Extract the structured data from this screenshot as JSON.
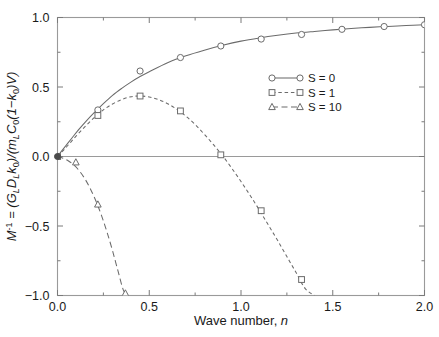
{
  "chart_data": {
    "type": "line",
    "title": "",
    "xlabel": "Wave number, n",
    "ylabel": "M^-1 = (G_L D_L k_0)/(m_L C_0 (1-k_0) V)",
    "xlim": [
      0.0,
      2.0
    ],
    "ylim": [
      -1.0,
      1.0
    ],
    "xticks": [
      0.0,
      0.5,
      1.0,
      1.5,
      2.0
    ],
    "xticklabels": [
      "0.0",
      "0.5",
      "1.0",
      "1.5",
      "2.0"
    ],
    "yticks": [
      -1.0,
      -0.5,
      0.0,
      0.5,
      1.0
    ],
    "yticklabels": [
      "-1.0",
      "-0.5",
      "0.0",
      "0.5",
      "1.0"
    ],
    "xminorticks": [
      0.25,
      0.75,
      1.25,
      1.75
    ],
    "yminorticks": [
      -0.75,
      -0.25,
      0.25,
      0.75
    ],
    "grid": false,
    "legend_position": "center-right",
    "zero_line": true,
    "series": [
      {
        "name": "S = 0",
        "linestyle": "solid",
        "marker": "circle",
        "color": "#6b6b6b",
        "x": [
          0.0,
          0.02,
          0.05,
          0.08,
          0.12,
          0.16,
          0.2,
          0.25,
          0.3,
          0.35,
          0.4,
          0.45,
          0.5,
          0.6,
          0.7,
          0.8,
          0.9,
          1.0,
          1.1,
          1.2,
          1.3,
          1.4,
          1.5,
          1.6,
          1.7,
          1.8,
          1.9,
          2.0
        ],
        "y": [
          0.0,
          0.035,
          0.085,
          0.135,
          0.2,
          0.26,
          0.315,
          0.38,
          0.44,
          0.49,
          0.535,
          0.575,
          0.61,
          0.675,
          0.725,
          0.765,
          0.8,
          0.83,
          0.853,
          0.872,
          0.888,
          0.9,
          0.911,
          0.921,
          0.929,
          0.936,
          0.942,
          0.948
        ],
        "markers_x": [
          0.0,
          0.22,
          0.45,
          0.67,
          0.89,
          1.11,
          1.33,
          1.55,
          1.78,
          2.0
        ],
        "markers_y": [
          0.0,
          0.335,
          0.615,
          0.712,
          0.795,
          0.845,
          0.878,
          0.915,
          0.935,
          0.948
        ]
      },
      {
        "name": "S = 1",
        "linestyle": "dashed",
        "marker": "square",
        "color": "#6b6b6b",
        "x": [
          0.0,
          0.05,
          0.1,
          0.15,
          0.2,
          0.25,
          0.3,
          0.35,
          0.4,
          0.45,
          0.5,
          0.55,
          0.6,
          0.65,
          0.7,
          0.75,
          0.8,
          0.85,
          0.9,
          0.95,
          1.0,
          1.05,
          1.1,
          1.15,
          1.2,
          1.25,
          1.3,
          1.35,
          1.4
        ],
        "y": [
          0.0,
          0.07,
          0.145,
          0.215,
          0.28,
          0.335,
          0.378,
          0.41,
          0.43,
          0.435,
          0.428,
          0.41,
          0.38,
          0.34,
          0.29,
          0.23,
          0.16,
          0.085,
          0.005,
          -0.085,
          -0.18,
          -0.28,
          -0.385,
          -0.495,
          -0.605,
          -0.72,
          -0.835,
          -0.95,
          -1.0
        ],
        "markers_x": [
          0.0,
          0.22,
          0.45,
          0.67,
          0.89,
          1.11,
          1.33
        ],
        "markers_y": [
          0.0,
          0.295,
          0.435,
          0.328,
          0.012,
          -0.39,
          -0.885
        ]
      },
      {
        "name": "S = 10",
        "linestyle": "longdash",
        "marker": "triangle",
        "color": "#6b6b6b",
        "x": [
          0.0,
          0.03,
          0.06,
          0.09,
          0.12,
          0.15,
          0.18,
          0.21,
          0.24,
          0.27,
          0.3,
          0.33,
          0.36,
          0.385
        ],
        "y": [
          0.0,
          -0.012,
          -0.032,
          -0.062,
          -0.105,
          -0.162,
          -0.235,
          -0.322,
          -0.425,
          -0.545,
          -0.678,
          -0.825,
          -0.965,
          -1.0
        ],
        "markers_x": [
          0.0,
          0.1,
          0.22,
          0.37
        ],
        "markers_y": [
          0.0,
          -0.042,
          -0.345,
          -0.985
        ]
      }
    ]
  },
  "axes": {
    "xlabel_main": "Wave number,",
    "xlabel_var": "n"
  },
  "ylabel_parts": {
    "m": "M",
    "m_sup": "-1",
    "eq": "=",
    "num_open": "(",
    "g": "G",
    "g_sub": "L",
    "d": "D",
    "d_sub": "L",
    "k": "k",
    "k_sub": "0",
    "num_close": ")/(",
    "ml": "m",
    "ml_sub": "L",
    "c": "C",
    "c_sub": "0",
    "one_minus": "(1−",
    "k2": "k",
    "k2_sub": "0",
    "paren": ")",
    "v": "V",
    "end": ")"
  },
  "legend": {
    "items": [
      {
        "label": "S = 0"
      },
      {
        "label": "S = 1"
      },
      {
        "label": "S = 10"
      }
    ]
  }
}
